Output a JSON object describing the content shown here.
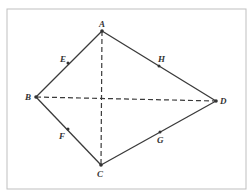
{
  "diagram": {
    "frame": {
      "x": 7,
      "y": 9,
      "w": 239,
      "h": 180,
      "stroke": "#bfbfbf"
    },
    "line_color": "#3a3a3a",
    "points": {
      "A": {
        "x": 102,
        "y": 31,
        "label": "A",
        "lx": 99,
        "ly": 27
      },
      "B": {
        "x": 36,
        "y": 97,
        "label": "B",
        "lx": 25,
        "ly": 100
      },
      "C": {
        "x": 101,
        "y": 165,
        "label": "C",
        "lx": 97,
        "ly": 177
      },
      "D": {
        "x": 216,
        "y": 101,
        "label": "D",
        "lx": 220,
        "ly": 104
      },
      "E": {
        "x": 68,
        "y": 63,
        "label": "E",
        "lx": 60,
        "ly": 62
      },
      "F": {
        "x": 68,
        "y": 129,
        "label": "F",
        "lx": 59,
        "ly": 139
      },
      "G": {
        "x": 160,
        "y": 132,
        "label": "G",
        "lx": 157,
        "ly": 143
      },
      "H": {
        "x": 159,
        "y": 66,
        "label": "H",
        "lx": 158,
        "ly": 62
      }
    },
    "solid_edges": [
      [
        "A",
        "B"
      ],
      [
        "B",
        "C"
      ],
      [
        "C",
        "D"
      ],
      [
        "D",
        "A"
      ]
    ],
    "dashed_edges": [
      [
        "A",
        "C"
      ],
      [
        "B",
        "D"
      ]
    ]
  }
}
